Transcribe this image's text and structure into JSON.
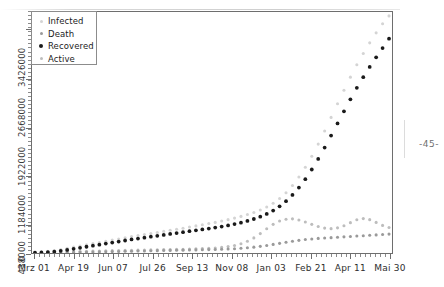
{
  "page": {
    "page_number": "-45-",
    "title_fragment": ""
  },
  "chart_data": {
    "type": "line",
    "title": "",
    "subtitle": "",
    "xlabel": "",
    "ylabel": "",
    "grid": false,
    "legend_position": "top-left",
    "marker_style": "dotted-points",
    "xlim": [
      "Mrz 01",
      "Mai 30"
    ],
    "ylim": [
      0,
      3700000
    ],
    "y_ticks": [
      0,
      438000,
      1184000,
      1922000,
      2668000,
      3426000
    ],
    "y_tick_labels": [
      "0",
      "438000",
      "1184000",
      "1922000",
      "2668000",
      "3426000"
    ],
    "x_tick_labels": [
      "Mrz 01",
      "Apr 19",
      "Jun 07",
      "Jul 26",
      "Sep 13",
      "Nov 08",
      "Jan 03",
      "Feb 21",
      "Apr 11",
      "Mai 30"
    ],
    "x_minor_ticks_per_major": 8,
    "colors": {
      "infected": "#d4d4d4",
      "death": "#9a9a9a",
      "recovered": "#1a1a1a",
      "active": "#bdbdbd"
    },
    "series": [
      {
        "name": "Infected",
        "color": "#d4d4d4",
        "values": [
          12000,
          18000,
          26000,
          38000,
          55000,
          72000,
          90000,
          108000,
          126000,
          144000,
          162000,
          180000,
          198000,
          216000,
          234000,
          252000,
          268000,
          284000,
          300000,
          316000,
          332000,
          348000,
          364000,
          380000,
          398000,
          416000,
          434000,
          452000,
          470000,
          490000,
          512000,
          536000,
          562000,
          590000,
          622000,
          660000,
          706000,
          764000,
          836000,
          926000,
          1036000,
          1166000,
          1316000,
          1486000,
          1672000,
          1872000,
          2082000,
          2292000,
          2498000,
          2700000,
          2890000,
          3064000,
          3226000,
          3380000,
          3520000,
          3640000
        ]
      },
      {
        "name": "Recovered",
        "color": "#1a1a1a",
        "values": [
          4000,
          8000,
          14000,
          22000,
          34000,
          48000,
          64000,
          80000,
          96000,
          112000,
          128000,
          144000,
          160000,
          176000,
          192000,
          208000,
          222000,
          236000,
          250000,
          264000,
          278000,
          292000,
          306000,
          320000,
          334000,
          348000,
          362000,
          376000,
          390000,
          406000,
          424000,
          444000,
          466000,
          492000,
          522000,
          558000,
          600000,
          652000,
          716000,
          796000,
          892000,
          1004000,
          1134000,
          1282000,
          1444000,
          1618000,
          1802000,
          1990000,
          2176000,
          2360000,
          2536000,
          2700000,
          2856000,
          3004000,
          3146000,
          3290000
        ]
      },
      {
        "name": "Active",
        "color": "#bdbdbd",
        "values": [
          6000,
          8000,
          10000,
          13000,
          17000,
          21000,
          24000,
          26000,
          28000,
          30000,
          32000,
          34000,
          36000,
          38000,
          40000,
          42000,
          44000,
          46000,
          48000,
          50000,
          52000,
          54000,
          56000,
          58000,
          60000,
          64000,
          68000,
          72000,
          78000,
          86000,
          98000,
          116000,
          142000,
          180000,
          232000,
          298000,
          372000,
          440000,
          490000,
          518000,
          524000,
          508000,
          476000,
          440000,
          406000,
          382000,
          374000,
          386000,
          418000,
          466000,
          510000,
          528000,
          512000,
          470000,
          424000,
          392000
        ]
      },
      {
        "name": "Death",
        "color": "#9a9a9a",
        "values": [
          1000,
          2000,
          3000,
          4000,
          6000,
          8000,
          10000,
          12000,
          14000,
          16000,
          18000,
          20000,
          22000,
          24000,
          26000,
          28000,
          30000,
          32000,
          34000,
          36000,
          38000,
          40000,
          42000,
          44000,
          46000,
          48000,
          50000,
          52000,
          55000,
          58000,
          62000,
          66000,
          72000,
          80000,
          90000,
          102000,
          116000,
          132000,
          148000,
          164000,
          180000,
          194000,
          206000,
          216000,
          224000,
          230000,
          236000,
          242000,
          248000,
          254000,
          260000,
          266000,
          272000,
          278000,
          284000,
          290000
        ]
      }
    ],
    "legend": [
      {
        "label": "Infected",
        "color": "#d4d4d4",
        "size": 3.0
      },
      {
        "label": "Death",
        "color": "#9a9a9a",
        "size": 3.0
      },
      {
        "label": "Recovered",
        "color": "#1a1a1a",
        "size": 4.0
      },
      {
        "label": "Active",
        "color": "#bdbdbd",
        "size": 3.0
      }
    ]
  }
}
